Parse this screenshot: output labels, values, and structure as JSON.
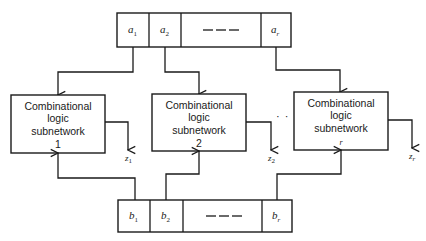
{
  "diagram": {
    "type": "block-diagram",
    "top_register": {
      "cells": [
        {
          "var": "a",
          "sub": "1"
        },
        {
          "var": "a",
          "sub": "2"
        },
        {
          "var": "",
          "sub": "",
          "ellipsis": "— — —"
        },
        {
          "var": "a",
          "sub": "r"
        }
      ]
    },
    "bottom_register": {
      "cells": [
        {
          "var": "b",
          "sub": "1"
        },
        {
          "var": "b",
          "sub": "2"
        },
        {
          "var": "",
          "sub": "",
          "ellipsis": "— — —"
        },
        {
          "var": "b",
          "sub": "r"
        }
      ]
    },
    "subnetworks": [
      {
        "line1": "Combinational",
        "line2": "logic",
        "line3": "subnetwork",
        "index": "1",
        "output_var": "z",
        "output_sub": "1"
      },
      {
        "line1": "Combinational",
        "line2": "logic",
        "line3": "subnetwork",
        "index": "2",
        "output_var": "z",
        "output_sub": "2"
      },
      {
        "line1": "Combinational",
        "line2": "logic",
        "line3": "subnetwork",
        "index": "r",
        "output_var": "z",
        "output_sub": "r"
      }
    ],
    "between_ellipsis": "· · ·",
    "colors": {
      "line": "#1a1a1a",
      "background": "#ffffff"
    }
  }
}
